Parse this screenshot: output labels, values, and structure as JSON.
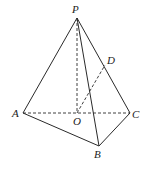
{
  "diagram": {
    "type": "tetrahedron",
    "stroke_color": "#2a2a2a",
    "points": {
      "P": {
        "label": "P",
        "x": 77,
        "y": 18
      },
      "A": {
        "label": "A",
        "x": 23,
        "y": 113
      },
      "B": {
        "label": "B",
        "x": 99,
        "y": 146
      },
      "C": {
        "label": "C",
        "x": 130,
        "y": 113
      },
      "O": {
        "label": "O",
        "x": 77,
        "y": 113
      },
      "D": {
        "label": "D",
        "x": 105,
        "y": 65
      }
    },
    "solid_edges": [
      "PA",
      "PB",
      "PC",
      "AB",
      "BC"
    ],
    "dashed_edges": [
      "AC",
      "PO",
      "OD"
    ]
  }
}
